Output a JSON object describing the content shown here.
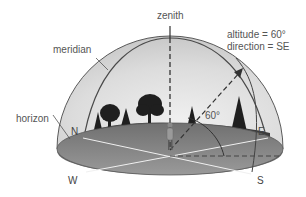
{
  "diagram": {
    "type": "celestial-horizon-coordinate-system",
    "labels": {
      "zenith": "zenith",
      "meridian": "meridian",
      "horizon": "horizon",
      "altitude": "altitude = 60°",
      "direction": "direction = SE",
      "angle": "60°"
    },
    "compass": {
      "north": "N",
      "east": "E",
      "south": "S",
      "west": "W"
    },
    "colors": {
      "dome_fill": "#d6d6d6",
      "dome_outline": "#555555",
      "ground_fill": "#8a8a8a",
      "ground_dark": "#6e6e6e",
      "hill_fill": "#3f3f3f",
      "tree_fill": "#222222",
      "direction_lines": "#f2f2f2",
      "label_text": "#555555"
    }
  }
}
